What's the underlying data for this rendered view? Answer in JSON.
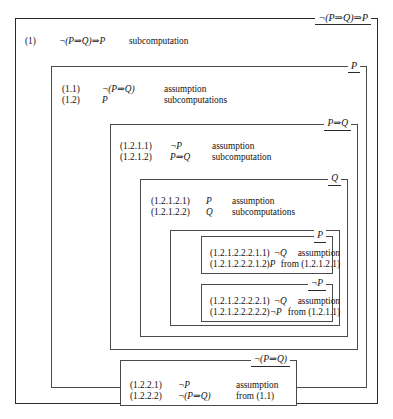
{
  "diagram": {
    "type": "nested-subcomputation-proof",
    "boxes": [
      {
        "id": "box-1",
        "level": 1,
        "label": "¬(P⇒Q)⇒P",
        "steps": [
          {
            "num": "(1)",
            "formula": "¬(P⇒Q)⇒P",
            "just": "subcomputation"
          }
        ]
      },
      {
        "id": "box-1-2",
        "level": 2,
        "label": "P",
        "steps": [
          {
            "num": "(1.1)",
            "formula": "¬(P⇒Q)",
            "just": "assumption"
          },
          {
            "num": "(1.2)",
            "formula": "P",
            "just": "subcomputations"
          }
        ]
      },
      {
        "id": "box-1-2-1",
        "level": 3,
        "label": "P⇒Q",
        "steps": [
          {
            "num": "(1.2.1.1)",
            "formula": "¬P",
            "just": "assumption"
          },
          {
            "num": "(1.2.1.2)",
            "formula": "P⇒Q",
            "just": "subcomputation"
          }
        ]
      },
      {
        "id": "box-1-2-1-2",
        "level": 4,
        "label": "Q",
        "steps": [
          {
            "num": "(1.2.1.2.1)",
            "formula": "P",
            "just": "assumption"
          },
          {
            "num": "(1.2.1.2.2)",
            "formula": "Q",
            "just": "subcomputations"
          }
        ]
      },
      {
        "id": "box-1-2-1-2-2",
        "level": 5,
        "label": "",
        "steps": []
      },
      {
        "id": "box-1-2-1-2-2-2-1",
        "level": 6,
        "label": "P",
        "steps": [
          {
            "num": "(1.2.1.2.2.2.1.1)",
            "formula": "¬Q",
            "just": "assumption"
          },
          {
            "num": "(1.2.1.2.2.2.1.2)",
            "formula": "P",
            "just": "from (1.2.1.2.1)"
          }
        ]
      },
      {
        "id": "box-1-2-1-2-2-2-2",
        "level": 6,
        "label": "¬P",
        "steps": [
          {
            "num": "(1.2.1.2.2.2.2.1)",
            "formula": "¬Q",
            "just": "assumption"
          },
          {
            "num": "(1.2.1.2.2.2.2.2)",
            "formula": "¬P",
            "just": "from (1.2.1.1)"
          }
        ]
      },
      {
        "id": "box-1-2-2",
        "level": 3,
        "label": "¬(P⇒Q)",
        "steps": [
          {
            "num": "(1.2.2.1)",
            "formula": "¬P",
            "just": "assumption"
          },
          {
            "num": "(1.2.2.2)",
            "formula": "¬(P⇒Q)",
            "just": "from (1.1)"
          }
        ]
      }
    ]
  },
  "colors": {
    "background": "#ffffff",
    "border": "#4a4a4a",
    "border_outer": "#2b2b2b",
    "text": "#111111"
  }
}
